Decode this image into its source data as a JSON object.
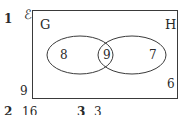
{
  "question": {
    "number": "1",
    "universal_symbol": "ℰ"
  },
  "venn": {
    "sets": [
      {
        "name": "G",
        "only_value": "8"
      },
      {
        "name": "H",
        "only_value": "7"
      }
    ],
    "intersection_value": "9",
    "outside_inside_box": "6",
    "outside_left_label": "9"
  },
  "footer": {
    "items": [
      {
        "number": "2",
        "value": "16"
      },
      {
        "number": "3",
        "value": "3"
      }
    ]
  },
  "colors": {
    "line": "#3a3a3a",
    "text": "#2a2a2a",
    "background": "#ffffff"
  }
}
